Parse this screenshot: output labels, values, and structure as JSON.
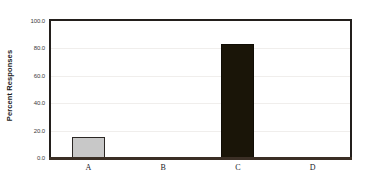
{
  "chart_data": {
    "type": "bar",
    "title": "",
    "xlabel": "",
    "ylabel": "Percent Responses",
    "categories": [
      "A",
      "B",
      "C",
      "D"
    ],
    "values": [
      15.0,
      0.4,
      83.5,
      0.4
    ],
    "ylim": [
      0.0,
      100.0
    ],
    "yticks": [
      0.0,
      20.0,
      40.0,
      60.0,
      80.0,
      100.0
    ],
    "ytick_labels": [
      "0.0",
      "20.0",
      "40.0",
      "60.0",
      "80.0",
      "100.0"
    ],
    "grid": true,
    "legend": false,
    "bar_colors": [
      "#c8c8c8",
      "#6e7a62",
      "#1a1508",
      "#6b4450"
    ],
    "bar_edge_color": "#231f1c",
    "background_color": "#ffffff",
    "frame_color": "#231f1c"
  },
  "axes": {
    "y_title": "Percent Responses",
    "y_ticks": [
      {
        "label": "100.0",
        "value": 100.0
      },
      {
        "label": "80.0",
        "value": 80.0
      },
      {
        "label": "60.0",
        "value": 60.0
      },
      {
        "label": "40.0",
        "value": 40.0
      },
      {
        "label": "20.0",
        "value": 20.0
      },
      {
        "label": "0.0",
        "value": 0.0
      }
    ],
    "x_ticks": [
      {
        "label": "A"
      },
      {
        "label": "B"
      },
      {
        "label": "C"
      },
      {
        "label": "D"
      }
    ]
  }
}
